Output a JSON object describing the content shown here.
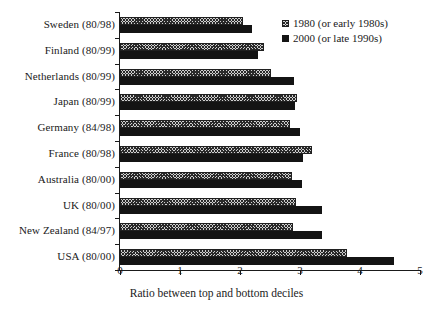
{
  "chart_data": {
    "type": "bar",
    "orientation": "horizontal",
    "title": "",
    "xlabel": "Ratio between top and bottom deciles",
    "ylabel": "",
    "xlim": [
      0,
      5
    ],
    "xticks": [
      0,
      1,
      2,
      3,
      4,
      5
    ],
    "xtick_labels": [
      "0",
      "1",
      "2",
      "3",
      "4",
      "5"
    ],
    "grid": false,
    "legend_position": "top-right",
    "categories": [
      "Sweden (80/98)",
      "Finland (80/99)",
      "Netherlands (80/99)",
      "Japan (80/99)",
      "Germany (84/98)",
      "France (80/98)",
      "Australia (80/00)",
      "UK (80/00)",
      "New Zealand (84/97)",
      "USA (80/00)"
    ],
    "series": [
      {
        "name": "1980 (or early 1980s)",
        "style": "hatched",
        "color": "#cfcfcf",
        "values": [
          2.05,
          2.4,
          2.52,
          2.95,
          2.83,
          3.2,
          2.87,
          2.93,
          2.88,
          3.78
        ]
      },
      {
        "name": "2000 (or late 1990s)",
        "style": "solid",
        "color": "#141414",
        "values": [
          2.2,
          2.3,
          2.9,
          2.92,
          3.0,
          3.05,
          3.03,
          3.37,
          3.37,
          4.57
        ]
      }
    ]
  }
}
